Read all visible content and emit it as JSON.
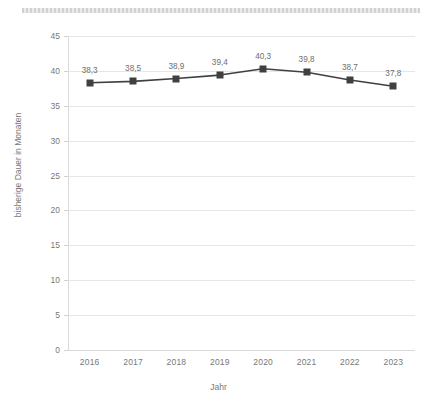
{
  "top_band": {
    "icon": "hatched-redaction-band"
  },
  "chart_data": {
    "type": "line",
    "title": "",
    "subtitle": "",
    "xlabel": "Jahr",
    "ylabel": "bisherige Dauer in Monaten",
    "categories": [
      "2016",
      "2017",
      "2018",
      "2019",
      "2020",
      "2021",
      "2022",
      "2023"
    ],
    "values": [
      38.3,
      38.5,
      38.9,
      39.4,
      40.3,
      39.8,
      38.7,
      37.8
    ],
    "point_labels": [
      "38,3",
      "38,5",
      "38,9",
      "39,4",
      "40,3",
      "39,8",
      "38,7",
      "37,8"
    ],
    "series": [
      {
        "name": "bisherige Dauer in Monaten",
        "values": [
          38.3,
          38.5,
          38.9,
          39.4,
          40.3,
          39.8,
          38.7,
          37.8
        ],
        "marker": "square",
        "color": "#404040"
      }
    ],
    "ylim": [
      0,
      45
    ],
    "yticks": [
      0,
      5,
      10,
      15,
      20,
      25,
      30,
      35,
      40,
      45
    ],
    "ytick_labels": [
      "0",
      "5",
      "10",
      "15",
      "20",
      "25",
      "30",
      "35",
      "40",
      "45"
    ],
    "grid": "horizontal",
    "legend": "none",
    "data_labels_visible": true,
    "colors": {
      "line": "#404040",
      "marker": "#404040",
      "gridline": "#e6e6e6",
      "axis": "#d9d9d9",
      "text": "#787878",
      "background": "#ffffff"
    }
  }
}
